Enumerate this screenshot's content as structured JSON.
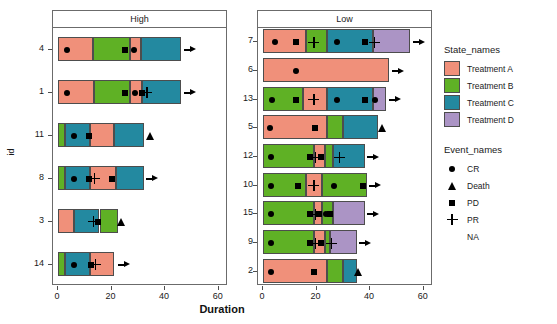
{
  "chart_data": {
    "type": "bar",
    "subtype": "swimmer-plot",
    "title": "",
    "xlabel": "Duration",
    "ylabel": "id",
    "xlim": [
      0,
      62
    ],
    "xticks": [
      0,
      20,
      40,
      60
    ],
    "xtick_labels": [
      "0",
      "20",
      "40",
      "60"
    ],
    "grid": false,
    "facet_variable": "",
    "legend_position": "right",
    "state_legend_title": "State_names",
    "event_legend_title": "Event_names",
    "states": [
      {
        "name": "Treatment A",
        "color": "#F0907A"
      },
      {
        "name": "Treatment B",
        "color": "#5FB125"
      },
      {
        "name": "Treatment C",
        "color": "#2389A0"
      },
      {
        "name": "Treatment D",
        "color": "#AB94C5"
      }
    ],
    "events": [
      {
        "name": "CR",
        "marker": "circle"
      },
      {
        "name": "Death",
        "marker": "triangle"
      },
      {
        "name": "PD",
        "marker": "square"
      },
      {
        "name": "PR",
        "marker": "plus"
      },
      {
        "name": "NA",
        "marker": "none"
      }
    ],
    "panels": [
      {
        "label": "High",
        "ids": [
          "4",
          "1",
          "11",
          "8",
          "3",
          "14"
        ],
        "rows": [
          {
            "id": "4",
            "segments": [
              {
                "state": "Treatment A",
                "start": 0,
                "end": 13
              },
              {
                "state": "Treatment B",
                "start": 13,
                "end": 27
              },
              {
                "state": "Treatment A",
                "start": 27,
                "end": 31
              },
              {
                "state": "Treatment C",
                "start": 31,
                "end": 46
              }
            ],
            "events": [
              {
                "name": "CR",
                "x": 3.2
              },
              {
                "name": "PD",
                "x": 25
              },
              {
                "name": "CR",
                "x": 28.5
              }
            ],
            "ongoing": true,
            "arrow_x": 47
          },
          {
            "id": "1",
            "segments": [
              {
                "state": "Treatment A",
                "start": 0,
                "end": 13.5
              },
              {
                "state": "Treatment B",
                "start": 13.5,
                "end": 27
              },
              {
                "state": "Treatment A",
                "start": 27,
                "end": 31.5
              },
              {
                "state": "Treatment C",
                "start": 31.5,
                "end": 46
              }
            ],
            "events": [
              {
                "name": "CR",
                "x": 3.2
              },
              {
                "name": "PD",
                "x": 25
              },
              {
                "name": "CR",
                "x": 28.6
              },
              {
                "name": "PD",
                "x": 31.4
              },
              {
                "name": "PR",
                "x": 33.2
              }
            ],
            "ongoing": true,
            "arrow_x": 47
          },
          {
            "id": "11",
            "segments": [
              {
                "state": "Treatment B",
                "start": 0,
                "end": 2.5
              },
              {
                "state": "Treatment C",
                "start": 2.5,
                "end": 12
              },
              {
                "state": "Treatment A",
                "start": 12,
                "end": 21
              },
              {
                "state": "Treatment C",
                "start": 21,
                "end": 32
              }
            ],
            "events": [
              {
                "name": "CR",
                "x": 6
              },
              {
                "name": "PD",
                "x": 11.5
              }
            ],
            "ongoing": false,
            "death_x": 34.5
          },
          {
            "id": "8",
            "segments": [
              {
                "state": "Treatment B",
                "start": 0,
                "end": 2.5
              },
              {
                "state": "Treatment C",
                "start": 2.5,
                "end": 12
              },
              {
                "state": "Treatment A",
                "start": 12,
                "end": 21.5
              },
              {
                "state": "Treatment C",
                "start": 21.5,
                "end": 32
              }
            ],
            "events": [
              {
                "name": "CR",
                "x": 6
              },
              {
                "name": "PD",
                "x": 11.5
              },
              {
                "name": "PR",
                "x": 13.5
              },
              {
                "name": "PD",
                "x": 20
              }
            ],
            "ongoing": true,
            "arrow_x": 33
          },
          {
            "id": "3",
            "segments": [
              {
                "state": "Treatment A",
                "start": 0,
                "end": 6
              },
              {
                "state": "Treatment C",
                "start": 6,
                "end": 15.5
              },
              {
                "state": "Treatment B",
                "start": 15.5,
                "end": 22.5
              }
            ],
            "events": [
              {
                "name": "PR",
                "x": 13.2
              },
              {
                "name": "PD",
                "x": 15
              }
            ],
            "ongoing": false,
            "death_x": 23.8
          },
          {
            "id": "14",
            "segments": [
              {
                "state": "Treatment B",
                "start": 0,
                "end": 2.5
              },
              {
                "state": "Treatment C",
                "start": 2.5,
                "end": 12
              },
              {
                "state": "Treatment A",
                "start": 12,
                "end": 21
              }
            ],
            "events": [
              {
                "name": "CR",
                "x": 6
              },
              {
                "name": "PD",
                "x": 12.2
              },
              {
                "name": "PR",
                "x": 14
              }
            ],
            "ongoing": true,
            "arrow_x": 22.5
          }
        ]
      },
      {
        "label": "Low",
        "ids": [
          "7",
          "6",
          "13",
          "5",
          "12",
          "10",
          "15",
          "9",
          "2"
        ],
        "rows": [
          {
            "id": "7",
            "segments": [
              {
                "state": "Treatment A",
                "start": 0,
                "end": 16
              },
              {
                "state": "Treatment B",
                "start": 16,
                "end": 24
              },
              {
                "state": "Treatment C",
                "start": 24,
                "end": 41
              },
              {
                "state": "Treatment D",
                "start": 41,
                "end": 55
              }
            ],
            "events": [
              {
                "name": "CR",
                "x": 4.5
              },
              {
                "name": "PD",
                "x": 12.5
              },
              {
                "name": "PR",
                "x": 19
              },
              {
                "name": "CR",
                "x": 27.5
              },
              {
                "name": "PD",
                "x": 38
              },
              {
                "name": "PR",
                "x": 41.5
              }
            ],
            "ongoing": true,
            "arrow_x": 56
          },
          {
            "id": "6",
            "segments": [
              {
                "state": "Treatment A",
                "start": 0,
                "end": 47
              }
            ],
            "events": [
              {
                "name": "CR",
                "x": 12.5
              }
            ],
            "ongoing": true,
            "arrow_x": 48
          },
          {
            "id": "13",
            "segments": [
              {
                "state": "Treatment B",
                "start": 0,
                "end": 15
              },
              {
                "state": "Treatment A",
                "start": 15,
                "end": 24
              },
              {
                "state": "Treatment C",
                "start": 24,
                "end": 41
              },
              {
                "state": "Treatment D",
                "start": 41,
                "end": 46
              }
            ],
            "events": [
              {
                "name": "CR",
                "x": 3.5
              },
              {
                "name": "PD",
                "x": 12.5
              },
              {
                "name": "PR",
                "x": 19
              },
              {
                "name": "CR",
                "x": 27.5
              },
              {
                "name": "PD",
                "x": 38
              },
              {
                "name": "CR",
                "x": 42
              }
            ],
            "ongoing": true,
            "arrow_x": 47
          },
          {
            "id": "5",
            "segments": [
              {
                "state": "Treatment A",
                "start": 0,
                "end": 24
              },
              {
                "state": "Treatment B",
                "start": 24,
                "end": 30
              },
              {
                "state": "Treatment C",
                "start": 30,
                "end": 43
              }
            ],
            "events": [
              {
                "name": "CR",
                "x": 2.5
              },
              {
                "name": "PD",
                "x": 19.5
              }
            ],
            "ongoing": false,
            "death_x": 44.5
          },
          {
            "id": "12",
            "segments": [
              {
                "state": "Treatment B",
                "start": 0,
                "end": 19
              },
              {
                "state": "Treatment A",
                "start": 19,
                "end": 23
              },
              {
                "state": "Treatment B",
                "start": 23,
                "end": 26
              },
              {
                "state": "Treatment C",
                "start": 26,
                "end": 38
              }
            ],
            "events": [
              {
                "name": "CR",
                "x": 3
              },
              {
                "name": "PD",
                "x": 17.5
              },
              {
                "name": "PR",
                "x": 19.5
              },
              {
                "name": "PD",
                "x": 21.5
              },
              {
                "name": "PR",
                "x": 28.5
              }
            ],
            "ongoing": true,
            "arrow_x": 39
          },
          {
            "id": "10",
            "segments": [
              {
                "state": "Treatment B",
                "start": 0,
                "end": 16
              },
              {
                "state": "Treatment A",
                "start": 16,
                "end": 22
              },
              {
                "state": "Treatment B",
                "start": 22,
                "end": 39
              }
            ],
            "events": [
              {
                "name": "CR",
                "x": 3
              },
              {
                "name": "PD",
                "x": 13
              },
              {
                "name": "PR",
                "x": 19
              },
              {
                "name": "CR",
                "x": 26.5
              },
              {
                "name": "PD",
                "x": 37.5
              }
            ],
            "ongoing": true,
            "arrow_x": 39.5
          },
          {
            "id": "15",
            "segments": [
              {
                "state": "Treatment B",
                "start": 0,
                "end": 19
              },
              {
                "state": "Treatment A",
                "start": 19,
                "end": 22
              },
              {
                "state": "Treatment B",
                "start": 22,
                "end": 26
              },
              {
                "state": "Treatment D",
                "start": 26,
                "end": 38
              }
            ],
            "events": [
              {
                "name": "CR",
                "x": 3
              },
              {
                "name": "PD",
                "x": 17.5
              },
              {
                "name": "PR",
                "x": 19.5
              },
              {
                "name": "PD",
                "x": 21
              },
              {
                "name": "CR",
                "x": 23.5
              },
              {
                "name": "PD",
                "x": 25
              }
            ],
            "ongoing": true,
            "arrow_x": 39
          },
          {
            "id": "9",
            "segments": [
              {
                "state": "Treatment B",
                "start": 0,
                "end": 19
              },
              {
                "state": "Treatment A",
                "start": 19,
                "end": 23
              },
              {
                "state": "Treatment B",
                "start": 23,
                "end": 25
              },
              {
                "state": "Treatment D",
                "start": 25,
                "end": 35
              }
            ],
            "events": [
              {
                "name": "CR",
                "x": 3
              },
              {
                "name": "PD",
                "x": 17.5
              },
              {
                "name": "PR",
                "x": 19.5
              },
              {
                "name": "PD",
                "x": 21.5
              },
              {
                "name": "PR",
                "x": 25.5
              }
            ],
            "ongoing": true,
            "arrow_x": 36
          },
          {
            "id": "2",
            "segments": [
              {
                "state": "Treatment A",
                "start": 0,
                "end": 24
              },
              {
                "state": "Treatment B",
                "start": 24,
                "end": 30
              },
              {
                "state": "Treatment C",
                "start": 30,
                "end": 35
              }
            ],
            "events": [
              {
                "name": "CR",
                "x": 3
              },
              {
                "name": "PD",
                "x": 19
              }
            ],
            "ongoing": false,
            "death_x": 35.5
          }
        ]
      }
    ]
  }
}
